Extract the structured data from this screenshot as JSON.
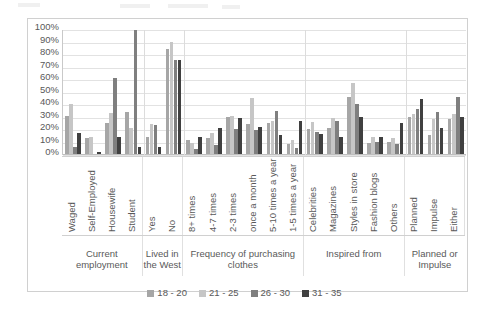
{
  "chart_data": {
    "type": "bar",
    "title": "",
    "xlabel": "",
    "ylabel": "",
    "ylim": [
      0,
      100
    ],
    "grid": true,
    "legend_position": "bottom",
    "y_ticks": [
      "0%",
      "10%",
      "20%",
      "30%",
      "40%",
      "50%",
      "60%",
      "70%",
      "80%",
      "90%",
      "100%"
    ],
    "y_tick_values": [
      0,
      10,
      20,
      30,
      40,
      50,
      60,
      70,
      80,
      90,
      100
    ],
    "series": [
      {
        "name": "18 - 20",
        "color": "#a6a6a6"
      },
      {
        "name": "21 - 25",
        "color": "#c6c6c6"
      },
      {
        "name": "26 - 30",
        "color": "#7f7f7f"
      },
      {
        "name": "31 - 35",
        "color": "#404040"
      }
    ],
    "groups": [
      {
        "title": "Current employment",
        "categories": [
          "Waged",
          "Self-Employed",
          "Housewife",
          "Student"
        ],
        "values": [
          [
            31,
            40,
            6,
            17
          ],
          [
            13,
            14,
            0,
            2
          ],
          [
            25,
            33,
            61,
            14
          ],
          [
            34,
            21,
            100,
            6
          ]
        ]
      },
      {
        "title": "Lived in the West",
        "categories": [
          "Yes",
          "No"
        ],
        "values": [
          [
            14,
            24,
            23,
            6
          ],
          [
            85,
            90,
            76,
            76
          ]
        ]
      },
      {
        "title": "Frequency of purchasing clothes",
        "categories": [
          "8+ times",
          "4-7 times",
          "2-3 times",
          "once a month",
          "5-10 times a year",
          "1-5 times a year"
        ],
        "values": [
          [
            11,
            9,
            4,
            14
          ],
          [
            13,
            17,
            7,
            21
          ],
          [
            30,
            31,
            20,
            29
          ],
          [
            24,
            45,
            19,
            22
          ],
          [
            25,
            27,
            35,
            15
          ],
          [
            8,
            11,
            5,
            27
          ]
        ]
      },
      {
        "title": "Inspired from",
        "categories": [
          "Celebrities",
          "Magazines",
          "Styles in store",
          "Fashion blogs",
          "Others"
        ],
        "values": [
          [
            20,
            26,
            18,
            16
          ],
          [
            21,
            29,
            27,
            14
          ],
          [
            46,
            57,
            40,
            30
          ],
          [
            9,
            14,
            10,
            14
          ],
          [
            10,
            13,
            8,
            25
          ]
        ]
      },
      {
        "title": "Planned or Impulse",
        "categories": [
          "Planned",
          "Impulse",
          "Either"
        ],
        "values": [
          [
            30,
            32,
            36,
            44
          ],
          [
            15,
            28,
            34,
            21
          ],
          [
            28,
            32,
            46,
            30
          ]
        ]
      }
    ]
  },
  "legend": {
    "items": [
      {
        "label": "18 - 20",
        "color": "#a6a6a6"
      },
      {
        "label": "21 - 25",
        "color": "#c6c6c6"
      },
      {
        "label": "26 - 30",
        "color": "#7f7f7f"
      },
      {
        "label": "31 - 35",
        "color": "#404040"
      }
    ]
  },
  "caption": {
    "text": ""
  }
}
